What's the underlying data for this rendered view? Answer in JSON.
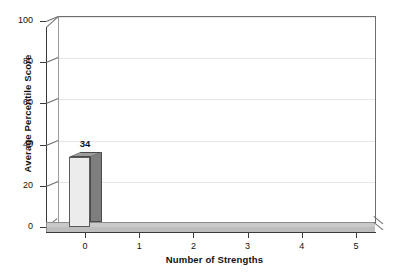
{
  "chart_data": {
    "type": "bar",
    "title": "",
    "xlabel": "Number of Strengths",
    "ylabel": "Average Percentile Score",
    "categories": [
      "0",
      "1",
      "2",
      "3",
      "4",
      "5"
    ],
    "values": [
      34,
      0,
      0,
      0,
      0,
      0
    ],
    "data_labels": [
      "34",
      "",
      "",
      "",
      "",
      ""
    ],
    "ylim": [
      0,
      100
    ],
    "yticks": [
      0,
      20,
      40,
      60,
      80,
      100
    ],
    "ytick_labels": [
      "0",
      "20",
      "40",
      "60",
      "80",
      "100"
    ],
    "xticks": [
      0,
      1,
      2,
      3,
      4,
      5
    ],
    "xtick_labels": [
      "0",
      "1",
      "2",
      "3",
      "4",
      "5"
    ],
    "grid": true,
    "grid_axis": "y",
    "legend": false,
    "style": "3d-column",
    "colors": {
      "bar_front": "#ececec",
      "bar_side": "#7e7e7e",
      "bar_top": "#9d9d9d",
      "floor": "#c9c9c9",
      "gridline": "#e6e6e6",
      "axis": "#3a3a3a",
      "wall_edge": "#6e6e6e",
      "text": "#111111",
      "background": "#ffffff"
    }
  }
}
